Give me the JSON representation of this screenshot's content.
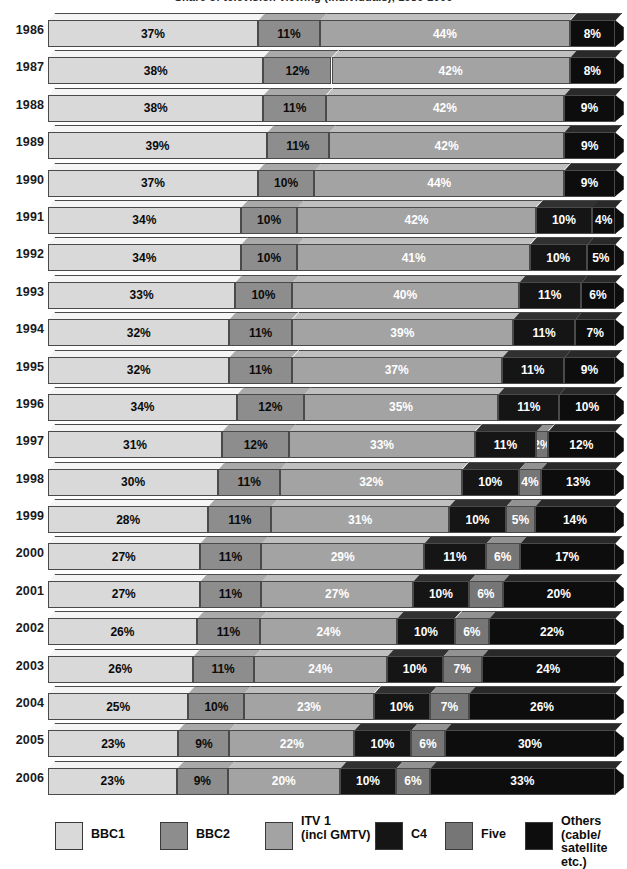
{
  "title": "Share of television viewing (individuals), 1986-2006",
  "legend": {
    "position": "bottom",
    "items": [
      {
        "label": "BBC1",
        "color": "#d9d9d9",
        "multiline": false
      },
      {
        "label": "BBC2",
        "color": "#8d8d8d",
        "multiline": false
      },
      {
        "label": "ITV 1\n(incl GMTV)",
        "color": "#a3a3a3",
        "multiline": true
      },
      {
        "label": "C4",
        "color": "#151515",
        "multiline": false
      },
      {
        "label": "Five",
        "color": "#767676",
        "multiline": false
      },
      {
        "label": "Others\n(cable/\nsatellite etc.)",
        "color": "#0d0d0d",
        "multiline": true
      }
    ]
  },
  "chart_data": {
    "type": "bar",
    "orientation": "horizontal",
    "stacked": true,
    "title": "Share of television viewing (individuals), 1986-2006",
    "xlabel": "",
    "ylabel": "",
    "xlim": [
      0,
      100
    ],
    "grid": false,
    "value_suffix": "%",
    "categories": [
      "1986",
      "1987",
      "1988",
      "1989",
      "1990",
      "1991",
      "1992",
      "1993",
      "1994",
      "1995",
      "1996",
      "1997",
      "1998",
      "1999",
      "2000",
      "2001",
      "2002",
      "2003",
      "2004",
      "2005",
      "2006"
    ],
    "series": [
      {
        "name": "BBC1",
        "color": "#d9d9d9",
        "text_color": "#0a0a0a",
        "values": [
          37,
          38,
          38,
          39,
          37,
          34,
          34,
          33,
          32,
          32,
          34,
          31,
          30,
          28,
          27,
          27,
          26,
          26,
          25,
          23,
          23
        ]
      },
      {
        "name": "BBC2",
        "color": "#8d8d8d",
        "text_color": "#0a0a0a",
        "values": [
          11,
          12,
          11,
          11,
          10,
          10,
          10,
          10,
          11,
          11,
          12,
          12,
          11,
          11,
          11,
          11,
          11,
          11,
          10,
          9,
          9
        ]
      },
      {
        "name": "ITV 1 (incl GMTV)",
        "color": "#a3a3a3",
        "text_color": "#ffffff",
        "values": [
          44,
          42,
          42,
          42,
          44,
          42,
          41,
          40,
          39,
          37,
          35,
          33,
          32,
          31,
          29,
          27,
          24,
          24,
          23,
          22,
          20
        ]
      },
      {
        "name": "C4",
        "color": "#151515",
        "text_color": "#ffffff",
        "values": [
          null,
          null,
          null,
          null,
          null,
          10,
          10,
          11,
          11,
          11,
          11,
          11,
          10,
          10,
          11,
          10,
          10,
          10,
          10,
          10,
          10
        ]
      },
      {
        "name": "Five",
        "color": "#767676",
        "text_color": "#ffffff",
        "values": [
          null,
          null,
          null,
          null,
          null,
          null,
          null,
          null,
          null,
          null,
          null,
          2,
          4,
          5,
          6,
          6,
          6,
          7,
          7,
          6,
          6
        ]
      },
      {
        "name": "Others (cable/satellite etc.)",
        "color": "#0d0d0d",
        "text_color": "#ffffff",
        "values": [
          8,
          8,
          9,
          9,
          9,
          4,
          5,
          6,
          7,
          9,
          10,
          12,
          13,
          14,
          17,
          20,
          22,
          24,
          26,
          30,
          33
        ]
      }
    ]
  }
}
